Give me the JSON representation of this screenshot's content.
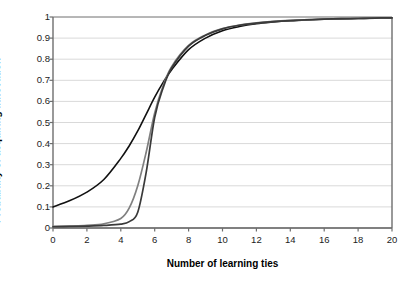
{
  "chart_data": {
    "type": "line",
    "title": "",
    "xlabel": "Number of learning ties",
    "ylabel": "Probability of acquiring innovation",
    "xlim": [
      0,
      20
    ],
    "ylim": [
      0,
      1
    ],
    "grid": true,
    "grid_axis": "y",
    "legend": "none",
    "xticks": [
      0,
      2,
      4,
      6,
      8,
      10,
      12,
      14,
      16,
      18,
      20
    ],
    "xticklabels": [
      "0",
      "2",
      "4",
      "6",
      "8",
      "10",
      "12",
      "14",
      "16",
      "18",
      "20"
    ],
    "yticks": [
      0,
      0.1,
      0.2,
      0.3,
      0.4,
      0.5,
      0.6,
      0.7,
      0.8,
      0.9,
      1
    ],
    "yticklabels": [
      "0",
      "0.1",
      "0.2",
      "0.3",
      "0.4",
      "0.5",
      "0.6",
      "0.7",
      "0.8",
      "0.9",
      "1"
    ],
    "x": [
      0,
      1,
      2,
      3,
      4,
      4.5,
      5,
      5.5,
      6,
      6.5,
      7,
      8,
      9,
      10,
      11,
      12,
      13,
      14,
      15,
      16,
      17,
      18,
      19,
      20
    ],
    "series": [
      {
        "name": "curve-black-shallow",
        "color": "#111111",
        "width": 1.6,
        "values": [
          0.1,
          0.13,
          0.17,
          0.23,
          0.33,
          0.39,
          0.46,
          0.54,
          0.62,
          0.69,
          0.75,
          0.845,
          0.9,
          0.935,
          0.955,
          0.968,
          0.976,
          0.982,
          0.986,
          0.989,
          0.991,
          0.993,
          0.995,
          0.996
        ]
      },
      {
        "name": "curve-gray-steep",
        "color": "#808080",
        "width": 1.7,
        "values": [
          0.008,
          0.01,
          0.013,
          0.02,
          0.045,
          0.095,
          0.2,
          0.36,
          0.545,
          0.675,
          0.765,
          0.865,
          0.915,
          0.945,
          0.962,
          0.972,
          0.979,
          0.984,
          0.988,
          0.99,
          0.992,
          0.994,
          0.995,
          0.996
        ]
      },
      {
        "name": "curve-dark-steep",
        "color": "#3a3a3a",
        "width": 1.7,
        "values": [
          0.006,
          0.007,
          0.009,
          0.012,
          0.018,
          0.03,
          0.075,
          0.265,
          0.525,
          0.665,
          0.758,
          0.862,
          0.913,
          0.944,
          0.961,
          0.971,
          0.978,
          0.983,
          0.987,
          0.99,
          0.992,
          0.993,
          0.995,
          0.996
        ]
      }
    ]
  },
  "axes": {
    "axis_color": "#6e6e6e",
    "grid_color": "#d9d9d9",
    "background": "#ffffff"
  }
}
